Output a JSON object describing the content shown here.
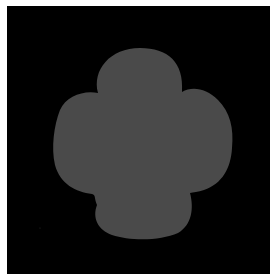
{
  "image": {
    "description": "Gray four-lobed blob (cloud/flower-like silhouette) centered on a black square background with a thin white border",
    "background_color": "#000000",
    "border_color": "#ffffff",
    "shape_color": "#4a4a4a",
    "shape": "four-lobed-blob"
  }
}
